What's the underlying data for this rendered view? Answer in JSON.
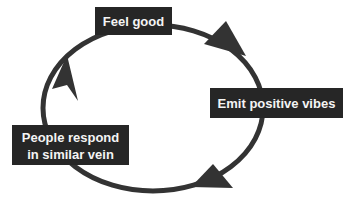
{
  "diagram": {
    "type": "cycle",
    "colors": {
      "box_fill": "#262626",
      "box_text": "#f4f4f4",
      "arrow": "#333333",
      "background": "#ffffff"
    },
    "nodes": [
      {
        "id": "feel-good",
        "lines": [
          "Feel good"
        ]
      },
      {
        "id": "emit-positive-vibes",
        "lines": [
          "Emit positive vibes"
        ]
      },
      {
        "id": "people-respond",
        "lines": [
          "People respond",
          "in similar vein"
        ]
      }
    ],
    "edges": [
      {
        "from": "feel-good",
        "to": "emit-positive-vibes",
        "direction": "clockwise"
      },
      {
        "from": "emit-positive-vibes",
        "to": "people-respond",
        "direction": "clockwise"
      },
      {
        "from": "people-respond",
        "to": "feel-good",
        "direction": "clockwise"
      }
    ]
  }
}
